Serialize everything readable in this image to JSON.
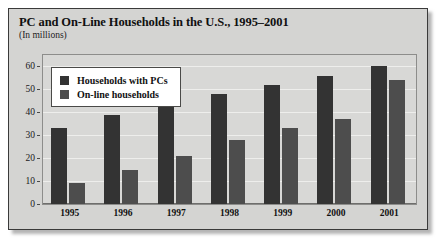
{
  "chart_data": {
    "type": "bar",
    "title": "PC and On-Line Households in the U.S., 1995–2001",
    "subtitle": "(In millions)",
    "xlabel": "",
    "ylabel": "",
    "ylim": [
      0,
      65
    ],
    "yticks": [
      0,
      10,
      20,
      30,
      40,
      50,
      60
    ],
    "grid": true,
    "legend_position": "top-left-inside",
    "categories": [
      "1995",
      "1996",
      "1997",
      "1998",
      "1999",
      "2000",
      "2001"
    ],
    "series": [
      {
        "name": "Households with PCs",
        "color": "#333333",
        "values": [
          33,
          39,
          44,
          48,
          52,
          56,
          60
        ]
      },
      {
        "name": "On-line households",
        "color": "#4d4d4d",
        "values": [
          9,
          15,
          21,
          28,
          33,
          37,
          54
        ]
      }
    ]
  },
  "legend": {
    "entries": [
      {
        "label": "Households with PCs"
      },
      {
        "label": "On-line households"
      }
    ]
  },
  "colors": {
    "series_pc": "#333333",
    "series_online": "#4d4d4d",
    "figure_background": "#d4d4d2",
    "plot_background": "#d8d8d6",
    "frame_border": "#3a3a3a",
    "gridline": "#eeeeec"
  }
}
